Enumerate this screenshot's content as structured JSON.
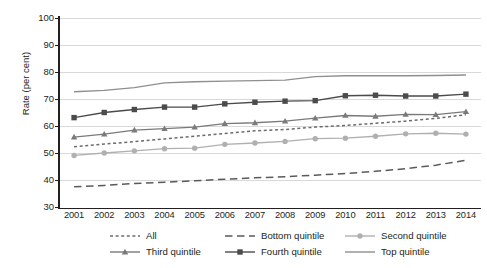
{
  "chart_data": {
    "type": "line",
    "title": "",
    "xlabel": "",
    "ylabel": "Rate (per cent)",
    "ylim": [
      30,
      100
    ],
    "yticks": [
      30,
      40,
      50,
      60,
      70,
      80,
      90,
      100
    ],
    "grid": true,
    "legend_position": "bottom",
    "categories": [
      "2001",
      "2002",
      "2003",
      "2004",
      "2005",
      "2006",
      "2007",
      "2008",
      "2009",
      "2010",
      "2011",
      "2012",
      "2013",
      "2014"
    ],
    "series": [
      {
        "name": "All",
        "color": "#6b6b6b",
        "style": "dotted",
        "marker": "none",
        "values": [
          52.3,
          53.3,
          54.2,
          55.2,
          56.2,
          57.2,
          58.2,
          58.7,
          59.6,
          60.2,
          61.0,
          61.8,
          62.8,
          64.2
        ]
      },
      {
        "name": "Bottom quintile",
        "color": "#5a5a5a",
        "style": "dashed",
        "marker": "none",
        "values": [
          37.5,
          38.0,
          38.7,
          39.2,
          39.7,
          40.3,
          40.8,
          41.2,
          41.8,
          42.4,
          43.2,
          44.2,
          45.5,
          47.3
        ]
      },
      {
        "name": "Second quintile",
        "color": "#b0b0b0",
        "style": "solid",
        "marker": "circle",
        "values": [
          49.1,
          50.0,
          50.8,
          51.6,
          51.8,
          53.2,
          53.7,
          54.3,
          55.3,
          55.5,
          56.2,
          57.1,
          57.3,
          57.0
        ]
      },
      {
        "name": "Third quintile",
        "color": "#7a7a7a",
        "style": "solid",
        "marker": "triangle",
        "values": [
          55.9,
          57.0,
          58.5,
          59.0,
          59.6,
          60.9,
          61.2,
          61.8,
          62.9,
          63.9,
          63.6,
          64.3,
          64.2,
          65.3
        ]
      },
      {
        "name": "Fourth quintile",
        "color": "#4b4b4b",
        "style": "solid",
        "marker": "square",
        "values": [
          63.1,
          65.0,
          66.1,
          67.0,
          67.0,
          68.2,
          68.8,
          69.2,
          69.4,
          71.2,
          71.4,
          71.1,
          71.1,
          71.8
        ]
      },
      {
        "name": "Top quintile",
        "color": "#8f8f8f",
        "style": "solid",
        "marker": "none",
        "values": [
          72.7,
          73.2,
          74.2,
          76.0,
          76.4,
          76.6,
          76.8,
          77.0,
          78.3,
          78.6,
          78.6,
          78.6,
          78.7,
          78.9
        ]
      }
    ]
  },
  "axis": {
    "y_title": "Rate (per cent)",
    "y_ticks": [
      "100",
      "90",
      "80",
      "70",
      "60",
      "50",
      "40",
      "30"
    ],
    "x_ticks": [
      "2001",
      "2002",
      "2003",
      "2004",
      "2005",
      "2006",
      "2007",
      "2008",
      "2009",
      "2010",
      "2011",
      "2012",
      "2013",
      "2014"
    ]
  },
  "legend": {
    "items": [
      {
        "label": "All"
      },
      {
        "label": "Bottom quintile"
      },
      {
        "label": "Second quintile"
      },
      {
        "label": "Third quintile"
      },
      {
        "label": "Fourth quintile"
      },
      {
        "label": "Top quintile"
      }
    ]
  }
}
